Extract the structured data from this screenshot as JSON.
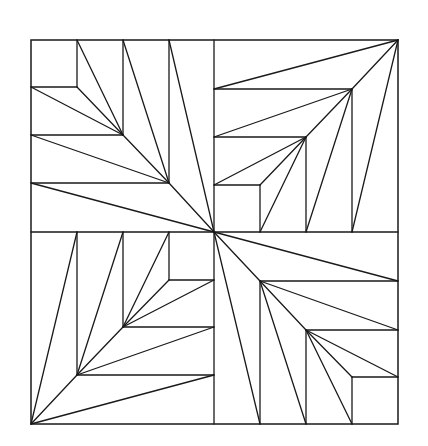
{
  "diagram": {
    "stroke_color": "#1a1a1a",
    "background": "#ffffff",
    "stroke_width": 1.3,
    "outer_border": {
      "x1": 31,
      "y1": 40,
      "x2": 398,
      "y2": 424
    },
    "center": {
      "x": 214,
      "y": 232
    },
    "quadrants": [
      {
        "name": "top-left",
        "lines": [
          [
            31,
            87,
            77,
            87
          ],
          [
            77,
            40,
            77,
            87
          ],
          [
            31,
            135,
            123,
            135
          ],
          [
            123,
            40,
            123,
            135
          ],
          [
            31,
            183,
            169,
            183
          ],
          [
            169,
            40,
            169,
            183
          ],
          [
            77,
            40,
            123,
            135
          ],
          [
            31,
            87,
            123,
            135
          ],
          [
            77,
            87,
            123,
            135
          ],
          [
            123,
            40,
            169,
            183
          ],
          [
            31,
            135,
            169,
            183
          ],
          [
            123,
            135,
            169,
            183
          ],
          [
            169,
            40,
            214,
            232
          ],
          [
            31,
            183,
            214,
            232
          ],
          [
            169,
            183,
            214,
            232
          ]
        ]
      },
      {
        "name": "top-right",
        "lines": [
          [
            214,
            89,
            352,
            89
          ],
          [
            352,
            89,
            352,
            232
          ],
          [
            214,
            137,
            306,
            137
          ],
          [
            306,
            137,
            306,
            232
          ],
          [
            214,
            185,
            260,
            185
          ],
          [
            260,
            185,
            260,
            232
          ],
          [
            214,
            89,
            398,
            40
          ],
          [
            352,
            232,
            398,
            40
          ],
          [
            352,
            89,
            398,
            40
          ],
          [
            214,
            137,
            352,
            89
          ],
          [
            306,
            232,
            352,
            89
          ],
          [
            306,
            137,
            352,
            89
          ],
          [
            214,
            185,
            306,
            137
          ],
          [
            260,
            232,
            306,
            137
          ],
          [
            260,
            185,
            306,
            137
          ]
        ]
      },
      {
        "name": "bottom-left",
        "lines": [
          [
            77,
            232,
            77,
            375
          ],
          [
            77,
            375,
            214,
            375
          ],
          [
            123,
            232,
            123,
            327
          ],
          [
            123,
            327,
            214,
            327
          ],
          [
            169,
            232,
            169,
            280
          ],
          [
            169,
            280,
            214,
            280
          ],
          [
            77,
            232,
            31,
            424
          ],
          [
            214,
            375,
            31,
            424
          ],
          [
            77,
            375,
            31,
            424
          ],
          [
            123,
            232,
            77,
            375
          ],
          [
            214,
            327,
            77,
            375
          ],
          [
            123,
            327,
            77,
            375
          ],
          [
            169,
            232,
            123,
            327
          ],
          [
            214,
            280,
            123,
            327
          ],
          [
            169,
            280,
            123,
            327
          ]
        ]
      },
      {
        "name": "bottom-right",
        "lines": [
          [
            260,
            281,
            398,
            281
          ],
          [
            260,
            281,
            260,
            424
          ],
          [
            306,
            330,
            398,
            330
          ],
          [
            306,
            330,
            306,
            424
          ],
          [
            352,
            377,
            398,
            377
          ],
          [
            352,
            377,
            352,
            424
          ],
          [
            398,
            281,
            214,
            232
          ],
          [
            260,
            424,
            214,
            232
          ],
          [
            260,
            281,
            214,
            232
          ],
          [
            398,
            330,
            260,
            281
          ],
          [
            306,
            424,
            260,
            281
          ],
          [
            306,
            330,
            260,
            281
          ],
          [
            398,
            377,
            306,
            330
          ],
          [
            352,
            424,
            306,
            330
          ],
          [
            352,
            377,
            306,
            330
          ]
        ]
      }
    ],
    "dividers": [
      [
        214,
        40,
        214,
        424
      ],
      [
        31,
        232,
        398,
        232
      ]
    ]
  }
}
